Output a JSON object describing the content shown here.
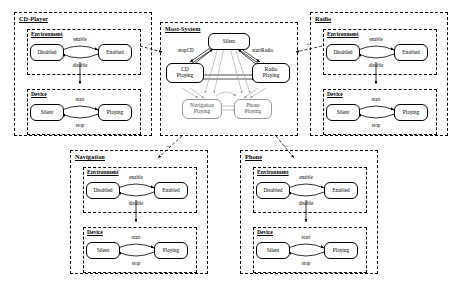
{
  "diagram": {
    "type": "uml-component-state-diagram",
    "packages": [
      {
        "id": "cd-player",
        "name": "CD-Player",
        "subsystems": [
          {
            "id": "cd-environment",
            "name": "Environment",
            "states": [
              "Disabled",
              "Enabled"
            ],
            "transitions": [
              {
                "from": "Disabled",
                "to": "Enabled",
                "label": "enable"
              },
              {
                "from": "Enabled",
                "to": "Disabled",
                "label": "disable"
              }
            ]
          },
          {
            "id": "cd-device",
            "name": "Device",
            "states": [
              "Silent",
              "Playing"
            ],
            "transitions": [
              {
                "from": "Silent",
                "to": "Playing",
                "label": "start"
              },
              {
                "from": "Playing",
                "to": "Silent",
                "label": "stop"
              }
            ]
          }
        ]
      },
      {
        "id": "radio",
        "name": "Radio",
        "subsystems": [
          {
            "id": "radio-environment",
            "name": "Environment",
            "states": [
              "Disabled",
              "Enabled"
            ],
            "transitions": [
              {
                "from": "Disabled",
                "to": "Enabled",
                "label": "enable"
              },
              {
                "from": "Enabled",
                "to": "Disabled",
                "label": "disable"
              }
            ]
          },
          {
            "id": "radio-device",
            "name": "Device",
            "states": [
              "Silent",
              "Playing"
            ],
            "transitions": [
              {
                "from": "Silent",
                "to": "Playing",
                "label": "start"
              },
              {
                "from": "Playing",
                "to": "Silent",
                "label": "stop"
              }
            ]
          }
        ]
      },
      {
        "id": "navigation",
        "name": "Navigation",
        "subsystems": [
          {
            "id": "nav-environment",
            "name": "Environment",
            "states": [
              "Disabled",
              "Enabled"
            ],
            "transitions": [
              {
                "from": "Disabled",
                "to": "Enabled",
                "label": "enable"
              },
              {
                "from": "Enabled",
                "to": "Disabled",
                "label": "disable"
              }
            ]
          },
          {
            "id": "nav-device",
            "name": "Device",
            "states": [
              "Silent",
              "Playing"
            ],
            "transitions": [
              {
                "from": "Silent",
                "to": "Playing",
                "label": "start"
              },
              {
                "from": "Playing",
                "to": "Silent",
                "label": "stop"
              }
            ]
          }
        ]
      },
      {
        "id": "phone",
        "name": "Phone",
        "subsystems": [
          {
            "id": "phone-environment",
            "name": "Environment",
            "states": [
              "Disabled",
              "Enabled"
            ],
            "transitions": [
              {
                "from": "Disabled",
                "to": "Enabled",
                "label": "enable"
              },
              {
                "from": "Enabled",
                "to": "Disabled",
                "label": "disable"
              }
            ]
          },
          {
            "id": "phone-device",
            "name": "Device",
            "states": [
              "Silent",
              "Playing"
            ],
            "transitions": [
              {
                "from": "Silent",
                "to": "Playing",
                "label": "start"
              },
              {
                "from": "Playing",
                "to": "Silent",
                "label": "stop"
              }
            ]
          }
        ]
      },
      {
        "id": "most-system",
        "name": "Most-System",
        "states": [
          "Silent",
          "CD\nPlaying",
          "Radio\nPlaying",
          "Navigation\nPlaying",
          "Phone\nPlaying"
        ],
        "transitions": [
          {
            "from": "CD Playing",
            "to": "Silent",
            "label": "stopCD"
          },
          {
            "from": "Silent",
            "to": "Radio Playing",
            "label": "startRadio"
          }
        ]
      }
    ],
    "dependencies": [
      {
        "from": "CD-Player",
        "to": "Most-System"
      },
      {
        "from": "Radio",
        "to": "Most-System"
      },
      {
        "from": "Most-System",
        "to": "Navigation"
      },
      {
        "from": "Most-System",
        "to": "Phone"
      }
    ]
  },
  "labels": {
    "cd_player": "CD-Player",
    "radio": "Radio",
    "navigation": "Navigation",
    "phone": "Phone",
    "most_system": "Most-System",
    "environment": "Environment",
    "device": "Device",
    "disabled": "Disabled",
    "enabled": "Enabled",
    "silent": "Silent",
    "playing": "Playing",
    "enable": "enable",
    "disable": "disable",
    "start": "start",
    "stop": "stop",
    "cd_playing_l1": "CD",
    "cd_playing_l2": "Playing",
    "radio_playing_l1": "Radio",
    "radio_playing_l2": "Playing",
    "nav_playing_l1": "Navigation",
    "nav_playing_l2": "Playing",
    "phone_playing_l1": "Phone",
    "phone_playing_l2": "Playing",
    "stopCD": "stopCD",
    "startRadio": "startRadio",
    "stereotype": "«»"
  },
  "colors": {
    "stroke": "#000000",
    "soft_stroke": "#9a9a9a",
    "background": "#ffffff"
  }
}
